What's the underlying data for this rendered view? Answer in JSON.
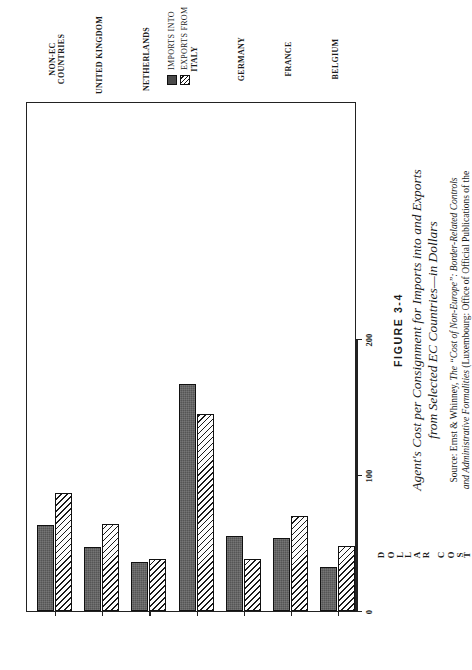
{
  "figure": {
    "number": "FIGURE 3-4",
    "title_line1": "Agent's Cost per Consignment for Imports into and Exports",
    "title_line2": "from Selected EC Countries—in Dollars",
    "source_prefix": "Source: Ernst & Whinney, ",
    "source_italic1": "The “Cost of Non-Europe”: Border-Related Controls",
    "source_italic2": "and Administrative Formalities",
    "source_suffix": " (Luxembourg: Office of Official Publications of the"
  },
  "legend": {
    "items": [
      {
        "label": "IMPORTS INTO",
        "swatch": "solid-square-icon",
        "color": "#555555"
      },
      {
        "label": "EXPORTS FROM",
        "swatch": "hatched-square-icon",
        "color": "#ffffff"
      }
    ]
  },
  "axis": {
    "title_letters": [
      "D",
      "O",
      "L",
      "L",
      "A",
      "R",
      " ",
      "C",
      "O",
      "S",
      "T"
    ],
    "title": "DOLLAR COST",
    "ticks": [
      0,
      100,
      200
    ],
    "tick_labels": [
      "0",
      "100",
      "200"
    ]
  },
  "chart_data": {
    "type": "bar",
    "orientation": "horizontal",
    "title": "Agent's Cost per Consignment for Imports into and Exports from Selected EC Countries—in Dollars",
    "xlabel": "DOLLAR COST",
    "ylabel": "",
    "xlim": [
      0,
      200
    ],
    "grid": false,
    "legend_position": "top-left",
    "categories": [
      "BELGIUM",
      "FRANCE",
      "GERMANY",
      "ITALY",
      "NETHERLANDS",
      "UNITED KINGDOM",
      "NON-EC COUNTRIES"
    ],
    "series": [
      {
        "name": "IMPORTS INTO",
        "values": [
          32,
          54,
          55,
          167,
          36,
          47,
          63
        ]
      },
      {
        "name": "EXPORTS FROM",
        "values": [
          48,
          70,
          38,
          145,
          38,
          64,
          87
        ]
      }
    ]
  }
}
